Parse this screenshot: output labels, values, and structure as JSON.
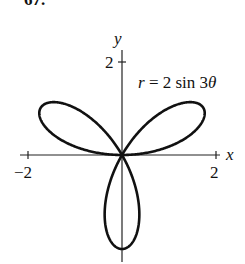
{
  "problem": {
    "number": "67."
  },
  "chart_data": {
    "type": "line",
    "subtype": "polar-rose",
    "title": "",
    "equation": "r = 2 sin 3θ",
    "equation_parts": {
      "r": "r",
      "eq": " = 2 sin 3",
      "theta": "θ"
    },
    "xlabel": "x",
    "ylabel": "y",
    "x_ticks": [
      {
        "value": -2,
        "label": "−2"
      },
      {
        "value": 2,
        "label": "2"
      }
    ],
    "y_ticks": [
      {
        "value": 2,
        "label": "2"
      }
    ],
    "xlim": [
      -2.2,
      2.2
    ],
    "ylim": [
      -2.2,
      2.3
    ],
    "grid": false,
    "legend": null,
    "petals": 3,
    "petal_tips": [
      {
        "angle_deg": 30,
        "x": 1.732,
        "y": 1.0
      },
      {
        "angle_deg": 150,
        "x": -1.732,
        "y": 1.0
      },
      {
        "angle_deg": 270,
        "x": 0.0,
        "y": -2.0
      }
    ],
    "series": [
      {
        "name": "r = 2 sin 3θ",
        "function": "2*sin(3*theta)",
        "theta_range": [
          0,
          3.14159
        ]
      }
    ]
  }
}
